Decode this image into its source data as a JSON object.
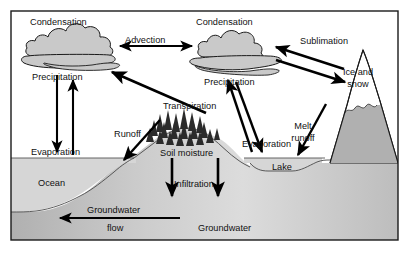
{
  "diagram": {
    "frame": {
      "border_color": "#1a1a1a",
      "background_color": "#ffffff"
    },
    "colors": {
      "land_fill": "#b0b0b0",
      "water_fill": "#d6d6d6",
      "cloud_fill": "#c9c9c9",
      "cloud_outline": "#1a1a1a",
      "snow_fill": "#ffffff",
      "arrow_color": "#000000",
      "text_color": "#111111",
      "aquifer_highlight": "#e2e2e2"
    },
    "labels": {
      "condensation_left": "Condensation",
      "condensation_right": "Condensation",
      "advection": "Advection",
      "sublimation": "Sublimation",
      "precipitation_left": "Precipitation",
      "precipitation_right": "Precipitation",
      "ice_and_snow_line1": "Ice and",
      "ice_and_snow_line2": "snow",
      "transpiration": "Transpiration",
      "melt_line1": "Melt",
      "melt_line2": "runoff",
      "evaporation_ocean": "Evaporation",
      "evaporation_lake": "Evaporation",
      "runoff": "Runoff",
      "soil_moisture": "Soil moisture",
      "lake": "Lake",
      "ocean": "Ocean",
      "infiltration": "Infiltration",
      "groundwater_flow_line1": "Groundwater",
      "groundwater_flow_line2": "flow",
      "groundwater": "Groundwater"
    },
    "processes": [
      {
        "name": "condensation",
        "label": "Condensation"
      },
      {
        "name": "advection",
        "label": "Advection"
      },
      {
        "name": "sublimation",
        "label": "Sublimation"
      },
      {
        "name": "precipitation",
        "label": "Precipitation"
      },
      {
        "name": "transpiration",
        "label": "Transpiration"
      },
      {
        "name": "evaporation",
        "label": "Evaporation"
      },
      {
        "name": "melt-runoff",
        "label": "Melt runoff"
      },
      {
        "name": "runoff",
        "label": "Runoff"
      },
      {
        "name": "infiltration",
        "label": "Infiltration"
      },
      {
        "name": "groundwater-flow",
        "label": "Groundwater flow"
      }
    ],
    "reservoirs": [
      {
        "name": "ocean",
        "label": "Ocean"
      },
      {
        "name": "lake",
        "label": "Lake"
      },
      {
        "name": "ice-and-snow",
        "label": "Ice and snow"
      },
      {
        "name": "soil-moisture",
        "label": "Soil moisture"
      },
      {
        "name": "groundwater",
        "label": "Groundwater"
      }
    ]
  }
}
